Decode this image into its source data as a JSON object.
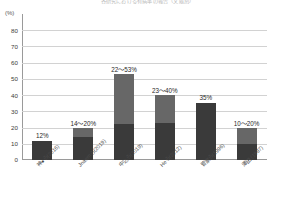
{
  "chart_data": {
    "type": "bar",
    "title": "各研究における有病率の報告（文献別）",
    "xlabel": "",
    "ylabel": "(%)",
    "ylim": [
      0,
      90
    ],
    "ytick_labels": [
      "80",
      "70",
      "60",
      "50",
      "40",
      "30",
      "20",
      "10",
      "0"
    ],
    "ytick_values": [
      80,
      70,
      60,
      50,
      40,
      30,
      20,
      10,
      0
    ],
    "grid": true,
    "legend": "none",
    "categories": [
      "神●ら(2016)",
      "Jnaemら(2019)",
      "中込ら(2019)",
      "Heら(2012)",
      "菅家ら(1996)",
      "澤田 (1987)"
    ],
    "series": [
      {
        "name": "下限値",
        "values": [
          12,
          14,
          22,
          23,
          35,
          10
        ]
      },
      {
        "name": "上限値（追加分）",
        "values": [
          0,
          6,
          31,
          17,
          0,
          10
        ]
      }
    ],
    "ranges": [
      {
        "min": 12,
        "max": 12
      },
      {
        "min": 14,
        "max": 20
      },
      {
        "min": 22,
        "max": 53
      },
      {
        "min": 23,
        "max": 40
      },
      {
        "min": 35,
        "max": 35
      },
      {
        "min": 10,
        "max": 20
      }
    ],
    "data_labels": [
      "12%",
      "14〜20%",
      "22〜53%",
      "23〜40%",
      "35%",
      "10〜20%"
    ],
    "colors": {
      "low_segment": "#3a3a3a",
      "high_segment": "#676767",
      "gridline": "#d2d2d2",
      "axis": "#9a9a9a",
      "text": "#2a2a2a"
    }
  }
}
